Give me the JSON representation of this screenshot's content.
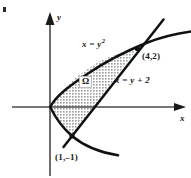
{
  "figure": {
    "kind": "cartesian-plane-region-diagram",
    "width": 191,
    "height": 178,
    "background": "#ffffff",
    "ink_color": "#111111",
    "shading_color": "#b3b3b3",
    "axes": {
      "x_label": "x",
      "y_label": "y",
      "origin_px": [
        50,
        107
      ],
      "x_axis_y_px": 107,
      "y_axis_x_px": 50,
      "unit_px": 21.8
    },
    "curves": [
      {
        "name": "parabola",
        "label": "x = y",
        "label_exponent": "2",
        "equation": "x = y^2",
        "label_pos_px": [
          82,
          40
        ]
      },
      {
        "name": "line",
        "label": "x = y + 2",
        "equation": "x = y + 2",
        "label_pos_px": [
          115,
          76
        ]
      }
    ],
    "points": [
      {
        "name": "upper-intersection",
        "label": "(4,2)",
        "coords": [
          4,
          2
        ],
        "px": [
          137,
          48
        ]
      },
      {
        "name": "lower-intersection",
        "label": "(1,–1)",
        "coords": [
          1,
          -1
        ],
        "px": [
          72,
          136
        ]
      }
    ],
    "region": {
      "name": "omega",
      "label": "Ω",
      "description": "region bounded by x = y^2 and x = y + 2",
      "label_pos_px": [
        79,
        76
      ]
    }
  }
}
